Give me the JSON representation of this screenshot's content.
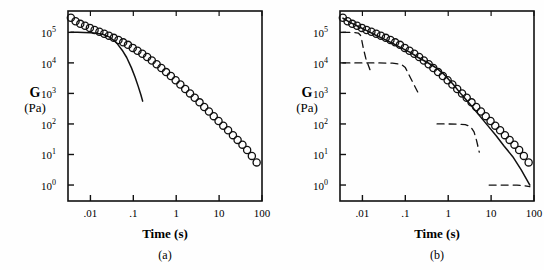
{
  "figure": {
    "x_axis_label": "Time (s)",
    "y_axis_symbol": "G",
    "y_axis_unit": "(Pa)"
  },
  "panels": [
    {
      "id": "a",
      "caption": "(a)"
    },
    {
      "id": "b",
      "caption": "(b)"
    }
  ],
  "ticks": {
    "x_labels": [
      ".01",
      ".1",
      "1",
      "10",
      "100"
    ],
    "x_values": [
      0.01,
      0.1,
      1,
      10,
      100
    ],
    "y_labels": [
      "10",
      "10",
      "10",
      "10",
      "10",
      "10"
    ],
    "y_exponents": [
      "0",
      "1",
      "2",
      "3",
      "4",
      "5"
    ],
    "y_values": [
      1,
      10,
      100,
      1000,
      10000,
      100000
    ]
  },
  "chart_data": [
    {
      "type": "scatter",
      "panel": "a",
      "title": "",
      "xlabel": "Time (s)",
      "ylabel": "G (Pa)",
      "xscale": "log",
      "yscale": "log",
      "xlim": [
        0.003,
        100
      ],
      "ylim": [
        0.3,
        500000
      ],
      "grid": false,
      "legend": "none",
      "series": [
        {
          "name": "experimental data",
          "marker": "open-circle",
          "x": [
            0.0035,
            0.0045,
            0.0058,
            0.0075,
            0.0097,
            0.0125,
            0.0162,
            0.021,
            0.027,
            0.035,
            0.045,
            0.058,
            0.075,
            0.097,
            0.125,
            0.162,
            0.21,
            0.27,
            0.35,
            0.45,
            0.58,
            0.75,
            0.97,
            1.25,
            1.62,
            2.1,
            2.7,
            3.5,
            4.5,
            5.8,
            7.5,
            9.7,
            12.5,
            16.2,
            21,
            27,
            35,
            45,
            58,
            75
          ],
          "y": [
            300000,
            230000,
            190000,
            165000,
            140000,
            120000,
            105000,
            90000,
            78000,
            66000,
            56000,
            47000,
            39000,
            31000,
            25000,
            20000,
            15500,
            12000,
            9000,
            6800,
            5000,
            3700,
            2700,
            1950,
            1400,
            1000,
            720,
            510,
            360,
            255,
            180,
            125,
            88,
            62,
            43,
            30,
            21,
            14,
            9,
            5.5
          ]
        },
        {
          "name": "single Maxwell model fit",
          "style": "solid-line",
          "x": [
            0.0035,
            0.005,
            0.007,
            0.01,
            0.014,
            0.02,
            0.028,
            0.04,
            0.055,
            0.07,
            0.09,
            0.11,
            0.13,
            0.15,
            0.165
          ],
          "y": [
            100000,
            100000,
            99000,
            97000,
            93000,
            85000,
            70000,
            47000,
            26000,
            15000,
            7000,
            3400,
            1700,
            900,
            560
          ]
        }
      ]
    },
    {
      "type": "scatter",
      "panel": "b",
      "title": "",
      "xlabel": "Time (s)",
      "ylabel": "G (Pa)",
      "xscale": "log",
      "yscale": "log",
      "xlim": [
        0.003,
        100
      ],
      "ylim": [
        0.3,
        500000
      ],
      "grid": false,
      "legend": "none",
      "series": [
        {
          "name": "experimental data",
          "marker": "open-circle",
          "x": [
            0.0035,
            0.0045,
            0.0058,
            0.0075,
            0.0097,
            0.0125,
            0.0162,
            0.021,
            0.027,
            0.035,
            0.045,
            0.058,
            0.075,
            0.097,
            0.125,
            0.162,
            0.21,
            0.27,
            0.35,
            0.45,
            0.58,
            0.75,
            0.97,
            1.25,
            1.62,
            2.1,
            2.7,
            3.5,
            4.5,
            5.8,
            7.5,
            9.7,
            12.5,
            16.2,
            21,
            27,
            35,
            45,
            58,
            75
          ],
          "y": [
            300000,
            230000,
            190000,
            165000,
            140000,
            120000,
            105000,
            90000,
            78000,
            66000,
            56000,
            47000,
            39000,
            31000,
            25000,
            20000,
            15500,
            12000,
            9000,
            6800,
            5000,
            3700,
            2700,
            1950,
            1400,
            1000,
            720,
            510,
            360,
            255,
            180,
            125,
            88,
            62,
            43,
            30,
            21,
            14,
            9,
            5.5
          ]
        },
        {
          "name": "generalized Maxwell model fit (sum of modes)",
          "style": "solid-line",
          "x": [
            0.0035,
            0.005,
            0.008,
            0.013,
            0.02,
            0.032,
            0.05,
            0.08,
            0.13,
            0.2,
            0.32,
            0.5,
            0.8,
            1.3,
            2.0,
            3.2,
            5.0,
            8.0,
            13.0,
            20.0,
            32.0,
            50.0,
            80.0
          ],
          "y": [
            290000,
            215000,
            155000,
            112000,
            82000,
            60000,
            44000,
            31000,
            22000,
            15000,
            10500,
            7200,
            4200,
            2000,
            950,
            450,
            210,
            95,
            42,
            19,
            8.5,
            3.2,
            1.0
          ]
        },
        {
          "name": "Maxwell mode 1",
          "style": "dashed-line",
          "plateau_modulus": 100000,
          "relaxation_time": 0.01,
          "x": [
            0.0035,
            0.006,
            0.008,
            0.009,
            0.0095,
            0.0105,
            0.012,
            0.015
          ],
          "y": [
            100000,
            100000,
            95000,
            80000,
            62000,
            30000,
            14000,
            6000
          ]
        },
        {
          "name": "Maxwell mode 2",
          "style": "dashed-line",
          "plateau_modulus": 10000,
          "relaxation_time": 0.1,
          "x": [
            0.0035,
            0.02,
            0.05,
            0.08,
            0.1,
            0.12,
            0.16,
            0.22
          ],
          "y": [
            10000,
            10000,
            9800,
            9000,
            7000,
            4200,
            1900,
            800
          ]
        },
        {
          "name": "Maxwell mode 3",
          "style": "dashed-line",
          "plateau_modulus": 100,
          "relaxation_time": 1.2,
          "x": [
            0.55,
            0.9,
            1.6,
            2.5,
            3.3,
            4.0,
            4.6,
            5.3
          ],
          "y": [
            100,
            100,
            99,
            95,
            82,
            55,
            28,
            12
          ]
        },
        {
          "name": "Maxwell mode 4",
          "style": "dashed-line",
          "plateau_modulus": 1,
          "relaxation_time": 30,
          "x": [
            9,
            15,
            25,
            40,
            60,
            80
          ],
          "y": [
            1.0,
            1.0,
            1.0,
            0.99,
            0.95,
            0.88
          ]
        }
      ]
    }
  ]
}
